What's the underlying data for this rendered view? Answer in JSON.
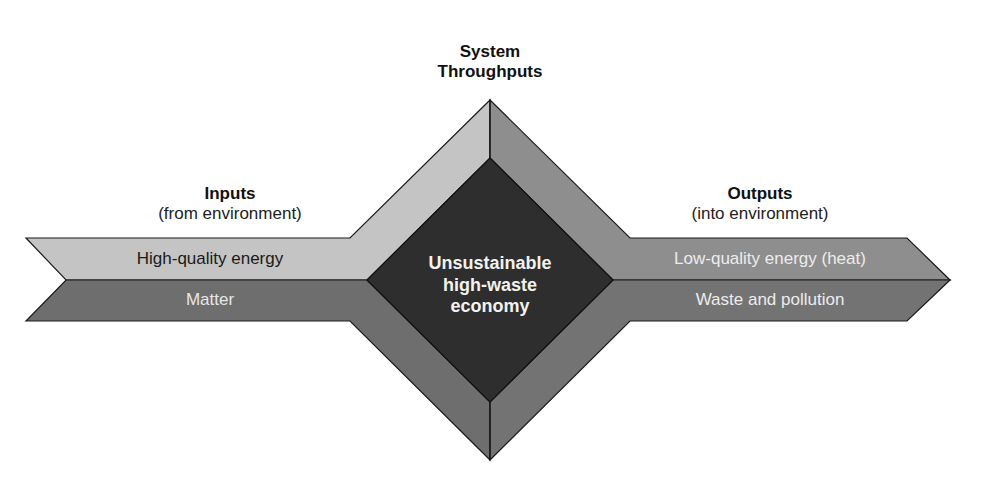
{
  "title": {
    "line1": "System",
    "line2": "Throughputs"
  },
  "inputs": {
    "heading": "Inputs",
    "subheading": "(from environment)",
    "bands": [
      {
        "label": "High-quality energy",
        "fill": "#c4c4c4",
        "text_color": "#1a1a1a"
      },
      {
        "label": "Matter",
        "fill": "#6e6e6e",
        "text_color": "#e6e6e6"
      }
    ]
  },
  "outputs": {
    "heading": "Outputs",
    "subheading": "(into environment)",
    "bands": [
      {
        "label": "Low-quality energy (heat)",
        "fill": "#8e8e8e",
        "text_color": "#ececec"
      },
      {
        "label": "Waste and pollution",
        "fill": "#6e6e6e",
        "text_color": "#ececec"
      }
    ]
  },
  "center": {
    "line1": "Unsustainable",
    "line2": "high-waste",
    "line3": "economy",
    "fill": "#2e2e2e"
  },
  "colors": {
    "light_gray": "#c4c4c4",
    "mid_gray": "#8e8e8e",
    "dark_gray": "#6e6e6e",
    "center_dark": "#2e2e2e",
    "outline": "#1a1a1a"
  }
}
